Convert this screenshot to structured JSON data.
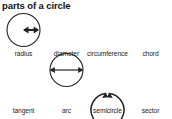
{
  "title": "parts of a circle",
  "colors": {
    "stroke": "#222222",
    "text": "#1a1a1a",
    "semicircle_fill": "#c9c9c9",
    "sector_fill": "#8a8a8a",
    "background": "#ffffff"
  },
  "figures": [
    {
      "id": "radius",
      "label": "radius",
      "icon": "circle-with-radius-arrow-icon",
      "description": "circle with a double-headed arrow from center to the right edge"
    },
    {
      "id": "diameter",
      "label": "diameter",
      "icon": "circle-with-diameter-arrow-icon",
      "description": "circle with a double-headed arrow spanning left edge to right edge through the center"
    },
    {
      "id": "circumference",
      "label": "circumference",
      "icon": "circle-with-circumference-arrows-icon",
      "description": "circle outline with a small gap at the top and two arrowheads meeting at the gap"
    },
    {
      "id": "chord",
      "label": "chord",
      "icon": "circle-with-chord-line-icon",
      "description": "circle with a straight line joining two points on the circumference, upper-left to right"
    },
    {
      "id": "tangent",
      "label": "tangent",
      "icon": "circle-with-tangent-line-icon",
      "description": "circle with a straight line touching the upper-right of the circumference at one point"
    },
    {
      "id": "arc",
      "label": "arc",
      "icon": "circle-with-arc-arrows-icon",
      "description": "circle with two arrowheads marking a portion of the circumference on the lower-right"
    },
    {
      "id": "semicircle",
      "label": "semicircle",
      "icon": "shaded-semicircle-icon",
      "description": "half disc shaded light grey with the straight diameter edge running diagonally"
    },
    {
      "id": "sector",
      "label": "sector",
      "icon": "shaded-sector-wedge-icon",
      "description": "pie-slice wedge shaded dark grey with the apex at the bottom and arc at the top"
    }
  ]
}
